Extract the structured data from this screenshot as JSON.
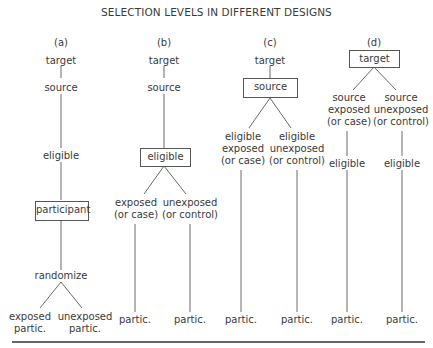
{
  "title": "SELECTION LEVELS IN DIFFERENT DESIGNS",
  "panels": {
    "a": {
      "label": "(a)",
      "target": "target",
      "source": "source",
      "eligible": "eligible",
      "participant": "participant",
      "randomize": "randomize",
      "leaf_left_1": "exposed",
      "leaf_left_2": "partic.",
      "leaf_right_1": "unexposed",
      "leaf_right_2": "partic."
    },
    "b": {
      "label": "(b)",
      "target": "target",
      "source": "source",
      "eligible": "eligible",
      "left_1": "exposed",
      "left_2": "(or case)",
      "right_1": "unexposed",
      "right_2": "(or control)",
      "left_partic": "partic.",
      "right_partic": "partic."
    },
    "c": {
      "label": "(c)",
      "target": "target",
      "source": "source",
      "left_1": "eligible",
      "left_2": "exposed",
      "left_3": "(or case)",
      "right_1": "eligible",
      "right_2": "unexposed",
      "right_3": "(or control)",
      "left_partic": "partic.",
      "right_partic": "partic."
    },
    "d": {
      "label": "(d)",
      "target": "target",
      "left_1": "source",
      "left_2": "exposed",
      "left_3": "(or case)",
      "right_1": "source",
      "right_2": "unexposed",
      "right_3": "(or control)",
      "left_eligible": "eligible",
      "right_eligible": "eligible",
      "left_partic": "partic.",
      "right_partic": "partic."
    }
  }
}
